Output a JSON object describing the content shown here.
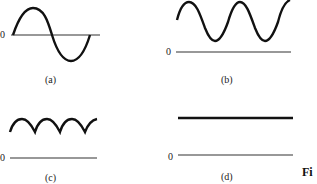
{
  "panels": [
    {
      "id": "a",
      "label": "(a)",
      "zero_label": "0",
      "description": "sine wave crossing the zero axis (one full period)"
    },
    {
      "id": "b",
      "label": "(b)",
      "zero_label": "0",
      "description": "sine wave offset above zero (DC + AC)"
    },
    {
      "id": "c",
      "label": "(c)",
      "zero_label": "0",
      "description": "full-wave rectified arches above zero"
    },
    {
      "id": "d",
      "label": "(d)",
      "zero_label": "0",
      "description": "constant horizontal line above zero (DC)"
    }
  ],
  "figure_caption_fragment": "Fi",
  "colors": {
    "curve": "#111111",
    "axis": "#333333",
    "background": "#ffffff"
  }
}
